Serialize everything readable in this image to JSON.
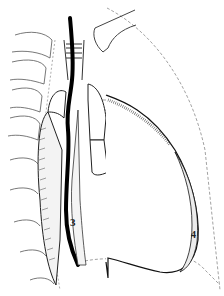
{
  "figure": {
    "type": "anatomical line drawing",
    "labels": [
      {
        "id": "3",
        "text": "3",
        "x": 72,
        "y": 224
      },
      {
        "id": "4",
        "text": "4",
        "x": 193,
        "y": 236
      }
    ],
    "colors": {
      "ink": "#111111",
      "dashed": "#8a8a8a",
      "background": "#ffffff"
    }
  }
}
